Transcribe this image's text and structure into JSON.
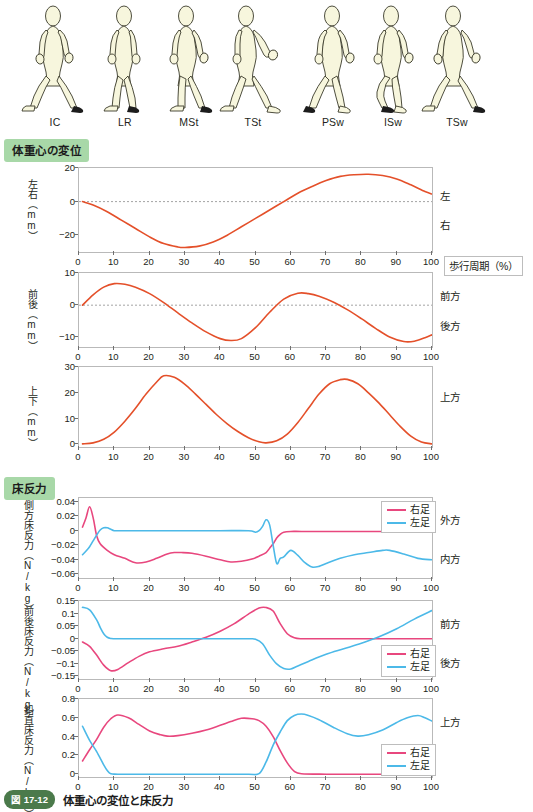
{
  "figure": {
    "caption_tag": "図 17-12",
    "caption_text": "体重心の変位と床反力"
  },
  "gait_cycle_figures": {
    "name": "walking-silhouette-sequence",
    "phases": [
      {
        "abbr": "IC",
        "x": 18
      },
      {
        "abbr": "LR",
        "x": 88
      },
      {
        "abbr": "MSt",
        "x": 152
      },
      {
        "abbr": "TSt",
        "x": 216
      },
      {
        "abbr": "PSw",
        "x": 296
      },
      {
        "abbr": "ISw",
        "x": 356
      },
      {
        "abbr": "TSw",
        "x": 420
      }
    ]
  },
  "sections": [
    {
      "id": "com-displacement",
      "label": "体重心の変位"
    },
    {
      "id": "ground-reaction-force",
      "label": "床反力"
    }
  ],
  "colors": {
    "com_line": "#e4502a",
    "right_foot": "#e8477e",
    "left_foot": "#4cb9e8",
    "badge_green": "#a8d8a8",
    "axis": "#b9b9b9",
    "zero_line": "#8b8b8b"
  },
  "legend": {
    "right_label": "右足",
    "left_label": "左足"
  },
  "x_axis": {
    "title": "歩行周期（%）",
    "ticks": [
      0,
      10,
      20,
      30,
      40,
      50,
      60,
      70,
      80,
      90,
      100
    ],
    "min": 0,
    "max": 100
  },
  "chart_data": [
    {
      "id": "mediolateral-displacement",
      "type": "line",
      "ylabel": "左右（mm）",
      "xlabel": "歩行周期（%）",
      "ylim": [
        -30,
        20
      ],
      "yticks": [
        -20,
        0,
        20
      ],
      "xlim": [
        0,
        100
      ],
      "right_labels": [
        {
          "text": "左",
          "value": 11
        },
        {
          "text": "右",
          "value": -14
        }
      ],
      "zero_line": true,
      "series": [
        {
          "name": "左右変位",
          "color": "#e4502a",
          "x": [
            1,
            4,
            8,
            12,
            16,
            20,
            24,
            28,
            30,
            34,
            38,
            42,
            46,
            50,
            54,
            58,
            62,
            66,
            70,
            74,
            78,
            82,
            86,
            90,
            94,
            98,
            100
          ],
          "y": [
            0,
            -2,
            -6,
            -11,
            -16,
            -21,
            -25,
            -27,
            -27.3,
            -26.5,
            -24,
            -20,
            -15,
            -10,
            -5,
            0,
            5,
            9,
            12.5,
            15,
            16,
            16.3,
            15.5,
            13.5,
            10,
            6,
            4.5
          ]
        }
      ]
    },
    {
      "id": "anteroposterior-displacement",
      "type": "line",
      "ylabel": "前後（mm）",
      "ylim": [
        -13,
        10
      ],
      "yticks": [
        -10,
        0,
        10
      ],
      "xlim": [
        0,
        100
      ],
      "right_labels": [
        {
          "text": "前方",
          "value": 5.5
        },
        {
          "text": "後方",
          "value": -5
        }
      ],
      "zero_line": true,
      "series": [
        {
          "name": "前後変位",
          "color": "#e4502a",
          "x": [
            1,
            4,
            7,
            10,
            13,
            16,
            20,
            24,
            28,
            32,
            36,
            40,
            43,
            46,
            50,
            54,
            58,
            62,
            65,
            68,
            72,
            76,
            80,
            84,
            88,
            92,
            95,
            98,
            100
          ],
          "y": [
            0,
            3.2,
            5.6,
            6.7,
            6.5,
            5.6,
            3.6,
            0.8,
            -2.4,
            -5.5,
            -8.3,
            -10.4,
            -11.0,
            -10.4,
            -7.0,
            -2.2,
            1.9,
            3.7,
            3.6,
            2.8,
            1.0,
            -1.4,
            -4.2,
            -7.2,
            -9.9,
            -11.3,
            -11.2,
            -10.1,
            -9.2
          ]
        }
      ]
    },
    {
      "id": "vertical-displacement",
      "type": "line",
      "ylabel": "上下（mm）",
      "ylim": [
        -1,
        30
      ],
      "yticks": [
        0,
        10,
        20,
        30
      ],
      "xlim": [
        0,
        100
      ],
      "right_labels": [
        {
          "text": "上方",
          "value": 23
        }
      ],
      "zero_line": false,
      "series": [
        {
          "name": "上下変位",
          "color": "#e4502a",
          "x": [
            1,
            4,
            7,
            10,
            13,
            16,
            19,
            22,
            24,
            27,
            30,
            33,
            36,
            39,
            42,
            45,
            48,
            51,
            53,
            56,
            59,
            62,
            65,
            68,
            71,
            74,
            76,
            79,
            82,
            85,
            88,
            91,
            94,
            97,
            100
          ],
          "y": [
            0.2,
            0.6,
            2.0,
            4.8,
            9.0,
            14.0,
            19.5,
            24.2,
            26.6,
            26.0,
            23.3,
            19.5,
            15.5,
            11.5,
            8.0,
            5.0,
            2.6,
            1.0,
            0.6,
            1.4,
            4.0,
            8.5,
            14.0,
            19.5,
            23.5,
            25.1,
            25.2,
            23.5,
            20.0,
            16.0,
            11.5,
            7.0,
            3.2,
            0.9,
            0.2
          ]
        }
      ]
    },
    {
      "id": "mediolateral-grf",
      "type": "line",
      "ylabel": "側方床反力（N/kg）",
      "ylim": [
        -0.065,
        0.045
      ],
      "yticks": [
        0.04,
        0.02,
        0,
        -0.02,
        -0.04,
        -0.06
      ],
      "ytick_labels": [
        "0.04",
        "0.02",
        "0",
        "-0.02",
        "-0.04",
        "-0.06"
      ],
      "xlim": [
        0,
        100
      ],
      "right_labels": [
        {
          "text": "外方",
          "value": 0.021
        },
        {
          "text": "内方",
          "value": -0.031
        }
      ],
      "legend_position": "top-right",
      "series": [
        {
          "name": "右足",
          "color": "#e8477e",
          "x": [
            1,
            2,
            3,
            4,
            5,
            6,
            8,
            10,
            13,
            16,
            19,
            22,
            25,
            27,
            29,
            32,
            36,
            40,
            43,
            46,
            49,
            51,
            53,
            54,
            55,
            56,
            57,
            58,
            60,
            63,
            70,
            80,
            90,
            100
          ],
          "y": [
            0.005,
            0.018,
            0.033,
            0.018,
            -0.007,
            -0.018,
            -0.027,
            -0.033,
            -0.038,
            -0.044,
            -0.043,
            -0.038,
            -0.032,
            -0.03,
            -0.03,
            -0.031,
            -0.035,
            -0.04,
            -0.043,
            -0.042,
            -0.039,
            -0.035,
            -0.03,
            -0.024,
            -0.018,
            -0.01,
            -0.005,
            -0.002,
            -0.001,
            -0.001,
            -0.001,
            -0.001,
            -0.001,
            -0.001
          ]
        },
        {
          "name": "左足",
          "color": "#4cb9e8",
          "x": [
            1,
            2,
            3,
            4,
            5,
            6,
            7,
            8,
            9,
            10,
            12,
            20,
            30,
            40,
            48,
            50,
            51,
            52,
            53,
            54,
            55,
            56,
            57,
            58,
            60,
            62,
            64,
            66,
            68,
            70,
            74,
            78,
            82,
            86,
            88,
            92,
            96,
            100
          ],
          "y": [
            -0.033,
            -0.028,
            -0.022,
            -0.014,
            -0.006,
            0.001,
            0.004,
            0.004,
            0.002,
            0.0,
            0.0,
            0.0,
            0.0,
            0.0,
            0.0,
            -0.002,
            0.0,
            0.006,
            0.015,
            0.008,
            -0.02,
            -0.045,
            -0.038,
            -0.036,
            -0.027,
            -0.034,
            -0.044,
            -0.05,
            -0.049,
            -0.045,
            -0.038,
            -0.033,
            -0.03,
            -0.027,
            -0.027,
            -0.032,
            -0.038,
            -0.04
          ]
        }
      ]
    },
    {
      "id": "anteroposterior-grf",
      "type": "line",
      "ylabel": "前後床反力（N/kg）",
      "ylim": [
        -0.16,
        0.15
      ],
      "yticks": [
        0.15,
        0.1,
        0.05,
        0,
        -0.05,
        -0.1,
        -0.15
      ],
      "ytick_labels": [
        "0.15",
        "0.1",
        "0.05",
        "0",
        "-0.05",
        "-0.1",
        "-0.15"
      ],
      "xlim": [
        0,
        100
      ],
      "right_labels": [
        {
          "text": "前方",
          "value": 0.095
        },
        {
          "text": "後方",
          "value": -0.072
        }
      ],
      "legend_position": "bottom-right",
      "series": [
        {
          "name": "右足",
          "color": "#e8477e",
          "x": [
            1,
            3,
            5,
            7,
            9,
            11,
            14,
            17,
            20,
            24,
            28,
            32,
            36,
            40,
            44,
            48,
            51,
            53,
            55,
            57,
            59,
            61,
            63,
            66,
            70,
            80,
            90,
            100
          ],
          "y": [
            -0.013,
            -0.03,
            -0.065,
            -0.105,
            -0.127,
            -0.122,
            -0.095,
            -0.07,
            -0.052,
            -0.04,
            -0.03,
            -0.013,
            0.006,
            0.03,
            0.06,
            0.098,
            0.122,
            0.124,
            0.11,
            0.06,
            0.02,
            0.004,
            0.0,
            0.0,
            0.0,
            0.0,
            0.0,
            0.0
          ]
        },
        {
          "name": "左足",
          "color": "#4cb9e8",
          "x": [
            1,
            3,
            5,
            6,
            7,
            8,
            9,
            10,
            14,
            20,
            30,
            40,
            48,
            50,
            52,
            54,
            56,
            58,
            60,
            62,
            65,
            70,
            75,
            80,
            85,
            90,
            95,
            100
          ],
          "y": [
            0.125,
            0.115,
            0.075,
            0.045,
            0.02,
            0.006,
            0.001,
            0.0,
            0.0,
            0.0,
            0.0,
            0.0,
            0.0,
            -0.002,
            -0.02,
            -0.065,
            -0.1,
            -0.118,
            -0.12,
            -0.108,
            -0.09,
            -0.062,
            -0.04,
            -0.018,
            0.008,
            0.04,
            0.078,
            0.112
          ]
        }
      ]
    },
    {
      "id": "vertical-grf",
      "type": "line",
      "ylabel": "鉛直床反力（N/kg）",
      "ylim": [
        -0.03,
        0.8
      ],
      "yticks": [
        0.8,
        0.6,
        0.4,
        0.2,
        0
      ],
      "ytick_labels": [
        "0.8",
        "0.6",
        "0.4",
        "0.2",
        "0"
      ],
      "xlim": [
        0,
        100
      ],
      "right_labels": [
        {
          "text": "上方",
          "value": 0.62
        }
      ],
      "legend_position": "bottom-right",
      "series": [
        {
          "name": "右足",
          "color": "#e8477e",
          "x": [
            1,
            3,
            5,
            7,
            9,
            11,
            14,
            17,
            20,
            23,
            25,
            28,
            32,
            36,
            40,
            43,
            46,
            49,
            51,
            53,
            55,
            57,
            59,
            61,
            63,
            70,
            80,
            90,
            100
          ],
          "y": [
            0.14,
            0.26,
            0.37,
            0.5,
            0.59,
            0.63,
            0.6,
            0.53,
            0.46,
            0.42,
            0.405,
            0.41,
            0.435,
            0.47,
            0.52,
            0.56,
            0.595,
            0.59,
            0.57,
            0.51,
            0.4,
            0.25,
            0.12,
            0.03,
            0.005,
            0.0,
            0.0,
            0.0,
            0.0
          ]
        },
        {
          "name": "左足",
          "color": "#4cb9e8",
          "x": [
            1,
            3,
            5,
            7,
            8,
            9,
            11,
            20,
            30,
            40,
            48,
            51,
            53,
            55,
            57,
            59,
            61,
            63,
            65,
            68,
            72,
            76,
            79,
            82,
            86,
            90,
            93,
            96,
            98,
            100
          ],
          "y": [
            0.51,
            0.36,
            0.24,
            0.1,
            0.04,
            0.005,
            0.0,
            0.0,
            0.0,
            0.0,
            0.0,
            0.005,
            0.13,
            0.31,
            0.45,
            0.57,
            0.625,
            0.64,
            0.625,
            0.58,
            0.5,
            0.43,
            0.405,
            0.42,
            0.47,
            0.55,
            0.6,
            0.625,
            0.6,
            0.565
          ]
        }
      ]
    }
  ]
}
